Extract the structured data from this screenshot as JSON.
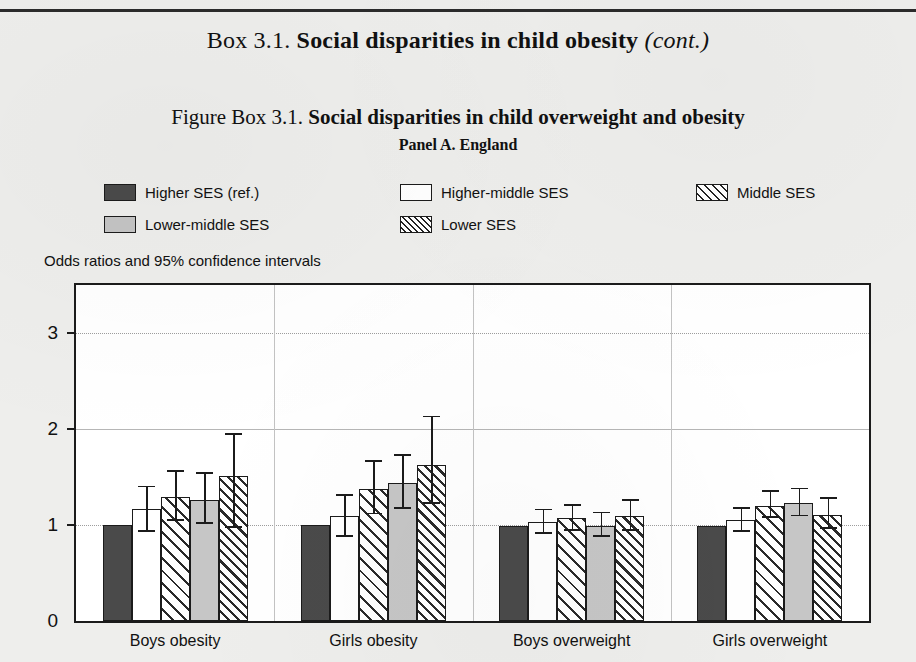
{
  "box": {
    "lead": "Box 3.1.",
    "strong": "Social disparities in child obesity",
    "cont": "(cont.)"
  },
  "figure": {
    "lead": "Figure Box 3.1.",
    "strong": "Social disparities in child overweight and obesity",
    "panel": "Panel A. England"
  },
  "axis_note": "Odds ratios and 95% confidence intervals",
  "legend": {
    "items": [
      {
        "label": "Higher SES (ref.)",
        "style": "dark",
        "color": "#4a4a4a"
      },
      {
        "label": "Higher-middle SES",
        "style": "white",
        "color": "#ffffff"
      },
      {
        "label": "Middle SES",
        "style": "hatch-sparse",
        "color": "#ffffff"
      },
      {
        "label": "Lower-middle SES",
        "style": "lgray",
        "color": "#c6c6c6"
      },
      {
        "label": "Lower SES",
        "style": "hatch-dense",
        "color": "#ffffff"
      }
    ]
  },
  "chart_data": {
    "type": "bar",
    "title": "Social disparities in child overweight and obesity",
    "subtitle": "Panel A. England",
    "xlabel": "",
    "ylabel": "Odds ratios and 95% confidence intervals",
    "ylim": [
      0,
      3.5
    ],
    "yticks": [
      0,
      1,
      2,
      3
    ],
    "ytick_labels": [
      "0",
      "1",
      "2",
      "3"
    ],
    "grid": true,
    "legend_position": "above-plot",
    "categories": [
      "Boys obesity",
      "Girls obesity",
      "Boys overweight",
      "Girls overweight"
    ],
    "series": [
      {
        "name": "Higher SES (ref.)",
        "values": [
          1.0,
          1.0,
          0.99,
          0.99
        ],
        "ci_low": [
          1.0,
          1.0,
          0.99,
          0.99
        ],
        "ci_high": [
          1.0,
          1.0,
          0.99,
          0.99
        ]
      },
      {
        "name": "Higher-middle SES",
        "values": [
          1.17,
          1.09,
          1.03,
          1.05
        ],
        "ci_low": [
          0.93,
          0.88,
          0.91,
          0.93
        ],
        "ci_high": [
          1.41,
          1.32,
          1.17,
          1.19
        ]
      },
      {
        "name": "Middle SES",
        "values": [
          1.29,
          1.38,
          1.07,
          1.2
        ],
        "ci_low": [
          1.04,
          1.11,
          0.94,
          1.07
        ],
        "ci_high": [
          1.57,
          1.68,
          1.22,
          1.36
        ]
      },
      {
        "name": "Lower-middle SES",
        "values": [
          1.26,
          1.44,
          0.99,
          1.23
        ],
        "ci_low": [
          1.01,
          1.17,
          0.88,
          1.09
        ],
        "ci_high": [
          1.55,
          1.74,
          1.14,
          1.39
        ]
      },
      {
        "name": "Lower SES",
        "values": [
          1.51,
          1.63,
          1.09,
          1.1
        ],
        "ci_low": [
          0.97,
          1.22,
          0.94,
          0.96
        ],
        "ci_high": [
          1.96,
          2.14,
          1.27,
          1.29
        ]
      }
    ]
  }
}
